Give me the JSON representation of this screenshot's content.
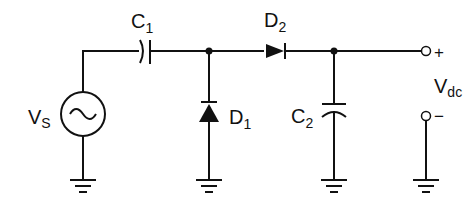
{
  "diagram": {
    "title": "",
    "type": "circuit",
    "components": {
      "source": {
        "label": "V",
        "sub": "S"
      },
      "c1": {
        "label": "C",
        "sub": "1"
      },
      "d1": {
        "label": "D",
        "sub": "1"
      },
      "d2": {
        "label": "D",
        "sub": "2"
      },
      "c2": {
        "label": "C",
        "sub": "2"
      },
      "output": {
        "label": "V",
        "sub": "dc",
        "plus": "+",
        "minus": "−"
      }
    }
  }
}
